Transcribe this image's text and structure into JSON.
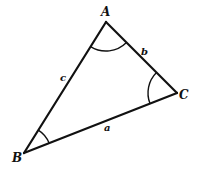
{
  "diagram": {
    "type": "triangle",
    "vertices": [
      {
        "name": "A",
        "x": 106,
        "y": 22
      },
      {
        "name": "B",
        "x": 24,
        "y": 153
      },
      {
        "name": "C",
        "x": 177,
        "y": 93
      }
    ],
    "vertex_labels": {
      "A": "A",
      "B": "B",
      "C": "C"
    },
    "sides": [
      {
        "name": "a",
        "from": "B",
        "to": "C",
        "label": "a"
      },
      {
        "name": "b",
        "from": "A",
        "to": "C",
        "label": "b"
      },
      {
        "name": "c",
        "from": "A",
        "to": "B",
        "label": "c"
      }
    ],
    "side_labels": {
      "a": "a",
      "b": "b",
      "c": "c"
    },
    "angle_marks": [
      "A",
      "B",
      "C"
    ],
    "stroke_color": "#111111",
    "background_color": "#ffffff"
  }
}
